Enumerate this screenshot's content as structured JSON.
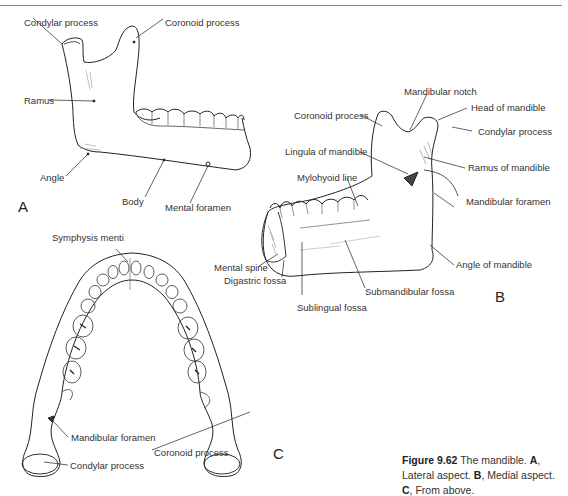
{
  "figure": {
    "number": "Figure 9.62",
    "caption": {
      "intro": "The mandible.",
      "parts": [
        {
          "key": "A",
          "text": ", Lateral aspect."
        },
        {
          "key": "B",
          "text": ", Medial aspect."
        },
        {
          "key": "C",
          "text": ", From above."
        }
      ]
    }
  },
  "panels": {
    "A": {
      "letter": "A",
      "view": "Lateral aspect",
      "labels": {
        "condylar": "Condylar process",
        "coronoid": "Coronoid process",
        "ramus": "Ramus",
        "angle": "Angle",
        "body": "Body",
        "mental_foramen": "Mental foramen"
      }
    },
    "B": {
      "letter": "B",
      "view": "Medial aspect",
      "labels": {
        "mandibular_notch": "Mandibular notch",
        "head": "Head of mandible",
        "coronoid": "Coronoid process",
        "condylar": "Condylar process",
        "lingula": "Lingula of mandible",
        "ramus": "Ramus of mandible",
        "mylohyoid": "Mylohyoid line",
        "mandibular_foramen": "Mandibular foramen",
        "mental_spine": "Mental spine",
        "angle": "Angle of mandible",
        "digastric": "Digastric fossa",
        "submandibular": "Submandibular fossa",
        "sublingual": "Sublingual fossa"
      }
    },
    "C": {
      "letter": "C",
      "view": "From above",
      "labels": {
        "symphysis": "Symphysis menti",
        "mandibular_foramen": "Mandibular foramen",
        "coronoid": "Coronoid process",
        "condylar": "Condylar process"
      }
    }
  }
}
